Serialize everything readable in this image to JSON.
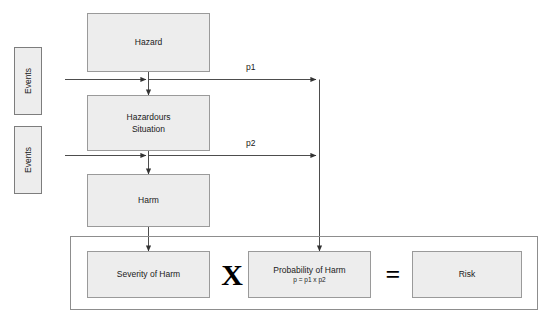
{
  "diagram": {
    "nodes": {
      "hazard": {
        "label": "Hazard"
      },
      "hazardous_situation": {
        "label": "Hazardours\nSituation",
        "line1": "Hazardours",
        "line2": "Situation"
      },
      "harm": {
        "label": "Harm"
      },
      "severity_of_harm": {
        "label": "Severity of Harm"
      },
      "probability_of_harm": {
        "label": "Probability of Harm",
        "formula": "p = p1 x p2"
      },
      "risk": {
        "label": "Risk"
      }
    },
    "inputs": [
      {
        "label": "Events",
        "feeds": "hazard-to-hazardous-situation",
        "probability": "p1"
      },
      {
        "label": "Events",
        "feeds": "hazardous-situation-to-harm",
        "probability": "p2"
      }
    ],
    "edge_labels": {
      "p1": "p1",
      "p2": "p2"
    },
    "operators": {
      "multiply": "X",
      "equals": "="
    },
    "colors": {
      "node_fill": "#ededed",
      "node_border": "#9a9a9a",
      "container_border": "#8d8d8d",
      "line": "#4d4d4d",
      "text": "#1a1a1a",
      "background": "#ffffff"
    }
  }
}
